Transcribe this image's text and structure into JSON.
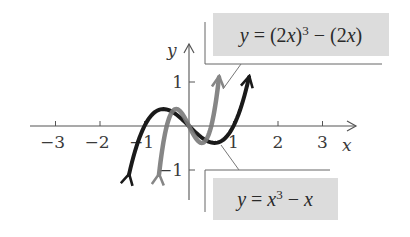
{
  "figure": {
    "axis_labels": {
      "x": "x",
      "y": "y"
    },
    "x_ticks": [
      {
        "value": -3,
        "label": "−3"
      },
      {
        "value": -2,
        "label": "−2"
      },
      {
        "value": -1,
        "label": "−1"
      },
      {
        "value": 1,
        "label": "1"
      },
      {
        "value": 2,
        "label": "2"
      },
      {
        "value": 3,
        "label": "3"
      }
    ],
    "y_ticks": [
      {
        "value": 1,
        "label": "1"
      },
      {
        "value": -1,
        "label": "−1"
      }
    ],
    "callouts": {
      "top": {
        "label": "y = (2x)³ − (2x)",
        "points_to": "gray curve"
      },
      "bottom": {
        "label": "y = x³ − x",
        "points_to": "black curve"
      }
    },
    "colors": {
      "black_curve": "#1a1a1a",
      "gray_curve": "#7a7a7a",
      "axis": "#555555",
      "callout_bg": "#dcdcdc"
    }
  },
  "chart_data": {
    "type": "line",
    "title": "",
    "xlabel": "x",
    "ylabel": "y",
    "xlim": [
      -3.5,
      3.8
    ],
    "ylim": [
      -1.7,
      1.9
    ],
    "grid": false,
    "series": [
      {
        "name": "y = x^3 - x",
        "color": "#1a1a1a",
        "x": [
          -1.35,
          -1.0,
          -0.577,
          0,
          0.577,
          1.0,
          1.35
        ],
        "y": [
          -1.11,
          0,
          0.385,
          0,
          -0.385,
          0,
          1.11
        ]
      },
      {
        "name": "y = (2x)^3 - (2x)",
        "color": "#7a7a7a",
        "x": [
          -0.675,
          -0.5,
          -0.289,
          0,
          0.289,
          0.5,
          0.675
        ],
        "y": [
          -1.11,
          0,
          0.385,
          0,
          -0.385,
          0,
          1.11
        ]
      }
    ]
  }
}
